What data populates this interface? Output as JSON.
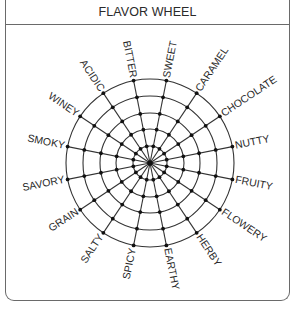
{
  "header": {
    "title": "FLAVOR WHEEL"
  },
  "wheel": {
    "center": [
      150,
      163
    ],
    "ring_radii": [
      17,
      34,
      50,
      67,
      84
    ],
    "spoke_count": 16,
    "start_angle_deg": -101.25,
    "step_deg": 22.5,
    "line_color": "#333333",
    "labels": [
      "BITTER",
      "SWEET",
      "CARAMEL",
      "CHOCOLATE",
      "NUTTY",
      "FRUITY",
      "FLOWERY",
      "HERBY",
      "EARTHY",
      "SPICY",
      "SALTY",
      "GRAIN",
      "SAVORY",
      "SMOKY",
      "WINEY",
      "ACIDIC"
    ]
  }
}
